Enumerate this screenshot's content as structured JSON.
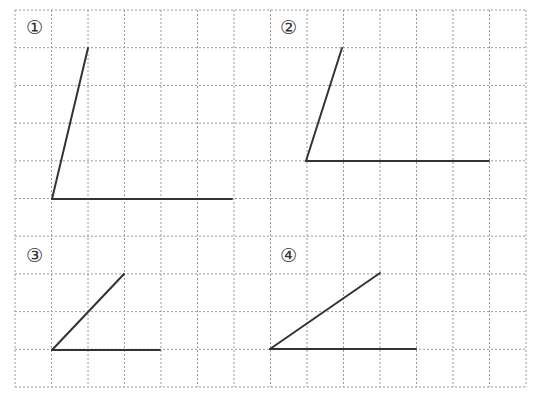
{
  "grid": {
    "left": 15,
    "top": 10,
    "right": 526,
    "bottom": 387,
    "cols": 14,
    "rows": 10,
    "line_color": "#9a9a9a",
    "dash": "2,2"
  },
  "figures": [
    {
      "label": "①",
      "label_pos": [
        26,
        18
      ],
      "vertex": [
        52,
        199
      ],
      "ray_up": [
        88,
        48
      ],
      "ray_h": [
        232,
        199
      ]
    },
    {
      "label": "②",
      "label_pos": [
        280,
        18
      ],
      "vertex": [
        306,
        161
      ],
      "ray_up": [
        342,
        48
      ],
      "ray_h": [
        489,
        161
      ]
    },
    {
      "label": "③",
      "label_pos": [
        26,
        246
      ],
      "vertex": [
        52,
        350
      ],
      "ray_up": [
        124,
        274
      ],
      "ray_h": [
        160,
        350
      ]
    },
    {
      "label": "④",
      "label_pos": [
        280,
        246
      ],
      "vertex": [
        270,
        349
      ],
      "ray_up": [
        380,
        273
      ],
      "ray_h": [
        416,
        349
      ]
    }
  ],
  "stroke_color": "#333333"
}
